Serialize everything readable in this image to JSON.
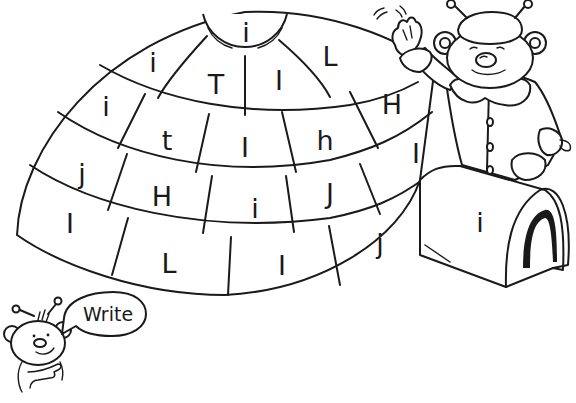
{
  "worksheet": {
    "instruction_bubble": "Write",
    "igloo": {
      "cap": {
        "letter": "i"
      },
      "rows": [
        {
          "row": 1,
          "bricks": [
            "i",
            "T",
            "I",
            "L"
          ]
        },
        {
          "row": 2,
          "bricks": [
            "i",
            "t",
            "I",
            "h",
            "H"
          ]
        },
        {
          "row": 3,
          "bricks": [
            "j",
            "H",
            "i",
            "J",
            "I"
          ]
        },
        {
          "row": 4,
          "bricks": [
            "I",
            "L",
            "I",
            "j"
          ]
        }
      ],
      "tunnel": {
        "letter": "i"
      }
    },
    "characters": [
      {
        "id": "bear-waving",
        "description": "bear in fur hat and coat waving"
      },
      {
        "id": "bear-pointing",
        "description": "small bear pointing at speech bubble"
      }
    ],
    "colors": {
      "ink": "#1a1a1a",
      "paper": "#ffffff"
    }
  }
}
